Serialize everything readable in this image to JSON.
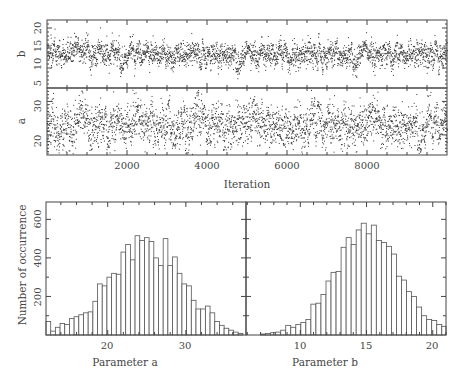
{
  "chart_data": [
    {
      "type": "scatter",
      "title": "",
      "panel": "trace-b",
      "xlabel": "Iteration",
      "ylabel": "b",
      "xlim": [
        0,
        10000
      ],
      "ylim": [
        5,
        22
      ],
      "xticks": [
        2000,
        4000,
        6000,
        8000
      ],
      "yticks": [
        5,
        10,
        15,
        20
      ],
      "series": [
        {
          "name": "b",
          "n_points": 3000,
          "mean": 13.8,
          "sd": 2.0
        }
      ]
    },
    {
      "type": "scatter",
      "title": "",
      "panel": "trace-a",
      "xlabel": "Iteration",
      "ylabel": "a",
      "xlim": [
        0,
        10000
      ],
      "ylim": [
        14,
        34
      ],
      "xticks": [
        2000,
        4000,
        6000,
        8000
      ],
      "yticks": [
        20,
        30
      ],
      "series": [
        {
          "name": "a",
          "n_points": 3000,
          "mean": 23.5,
          "sd": 4.0
        }
      ]
    },
    {
      "type": "bar",
      "title": "",
      "panel": "histogram-a",
      "xlabel": "Parameter a",
      "ylabel": "Number of occurrence",
      "xlim": [
        12.1,
        37.7
      ],
      "ylim": [
        0,
        690
      ],
      "xticks": [
        20,
        30
      ],
      "yticks": [
        200,
        400,
        600
      ],
      "bin_start": 12.1,
      "bin_width": 0.6,
      "values": [
        70,
        20,
        40,
        60,
        55,
        85,
        95,
        105,
        115,
        120,
        175,
        265,
        255,
        300,
        320,
        315,
        430,
        470,
        390,
        515,
        490,
        505,
        485,
        400,
        360,
        500,
        360,
        405,
        320,
        265,
        255,
        180,
        135,
        135,
        150,
        115,
        70,
        50,
        35,
        25,
        15,
        8
      ]
    },
    {
      "type": "bar",
      "title": "",
      "panel": "histogram-b",
      "xlabel": "Parameter b",
      "ylabel": "Number of occurrence",
      "xlim": [
        5.9,
        21.0
      ],
      "ylim": [
        0,
        690
      ],
      "xticks": [
        10,
        15,
        20
      ],
      "yticks": [
        200,
        400,
        600
      ],
      "bin_start": 7.0,
      "bin_width": 0.38,
      "values": [
        5,
        8,
        12,
        15,
        25,
        50,
        40,
        55,
        65,
        80,
        160,
        165,
        210,
        280,
        325,
        330,
        455,
        505,
        470,
        545,
        580,
        525,
        570,
        490,
        480,
        460,
        420,
        305,
        285,
        225,
        200,
        145,
        100,
        80,
        75,
        55,
        45,
        35,
        25,
        20,
        10,
        5,
        10,
        5
      ]
    }
  ],
  "labels": {
    "trace_b_ylabel": "b",
    "trace_a_ylabel": "a",
    "trace_xlabel": "Iteration",
    "hist_ylabel": "Number of occurrence",
    "hist_a_xlabel": "Parameter a",
    "hist_b_xlabel": "Parameter b"
  },
  "tick_labels": {
    "trace_b_y": [
      "5",
      "10",
      "15",
      "20"
    ],
    "trace_a_y": [
      "20",
      "30"
    ],
    "trace_x": [
      "2000",
      "4000",
      "6000",
      "8000"
    ],
    "hist_y": [
      "200",
      "400",
      "600"
    ],
    "hist_a_x": [
      "20",
      "30"
    ],
    "hist_b_x": [
      "10",
      "15",
      "20"
    ]
  },
  "colors": {
    "ink": "#333333",
    "frame": "#444444",
    "background": "#ffffff"
  }
}
